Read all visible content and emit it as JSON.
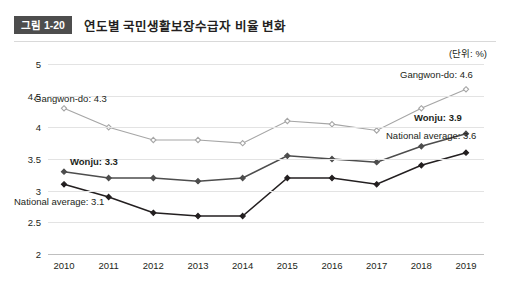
{
  "header": {
    "figure_badge": "그림 1-20",
    "title": "연도별 국민생활보장수급자 비율 변화"
  },
  "unit_note": "(단위: %)",
  "annotations": [
    {
      "key": "gangwon_left",
      "text": "Gangwon-do: 4.3",
      "bold": false
    },
    {
      "key": "gangwon_right",
      "text": "Gangwon-do: 4.6",
      "bold": false
    },
    {
      "key": "wonju_left",
      "text": "Wonju: 3.3",
      "bold": true
    },
    {
      "key": "wonju_right",
      "text": "Wonju: 3.9",
      "bold": true
    },
    {
      "key": "national_left",
      "text": "National average: 3.1",
      "bold": false
    },
    {
      "key": "national_right",
      "text": "National average: 3.6",
      "bold": false
    }
  ],
  "chart_data": {
    "type": "line",
    "title": "연도별 국민생활보장수급자 비율 변화",
    "xlabel": "",
    "ylabel": "",
    "unit": "(단위: %)",
    "ylim": [
      2,
      5
    ],
    "yticks": [
      "2",
      "2.5",
      "3",
      "3.5",
      "4",
      "4.5",
      "5"
    ],
    "grid": true,
    "legend": "annotated-endpoints",
    "categories": [
      "2010",
      "2011",
      "2012",
      "2013",
      "2014",
      "2015",
      "2016",
      "2017",
      "2018",
      "2019"
    ],
    "series": [
      {
        "name": "Gangwon-do",
        "color": "#a6a6a6",
        "values": [
          4.3,
          4.0,
          3.8,
          3.8,
          3.75,
          4.1,
          4.05,
          3.95,
          4.3,
          4.6
        ],
        "start_label": "Gangwon-do: 4.3",
        "end_label": "Gangwon-do: 4.6"
      },
      {
        "name": "Wonju",
        "color": "#4d4d4d",
        "values": [
          3.3,
          3.2,
          3.2,
          3.15,
          3.2,
          3.55,
          3.5,
          3.45,
          3.7,
          3.9
        ],
        "start_label": "Wonju: 3.3",
        "end_label": "Wonju: 3.9"
      },
      {
        "name": "National average",
        "color": "#231f20",
        "values": [
          3.1,
          2.9,
          2.65,
          2.6,
          2.6,
          3.2,
          3.2,
          3.1,
          3.4,
          3.6
        ],
        "start_label": "National average: 3.1",
        "end_label": "National average: 3.6"
      }
    ]
  }
}
